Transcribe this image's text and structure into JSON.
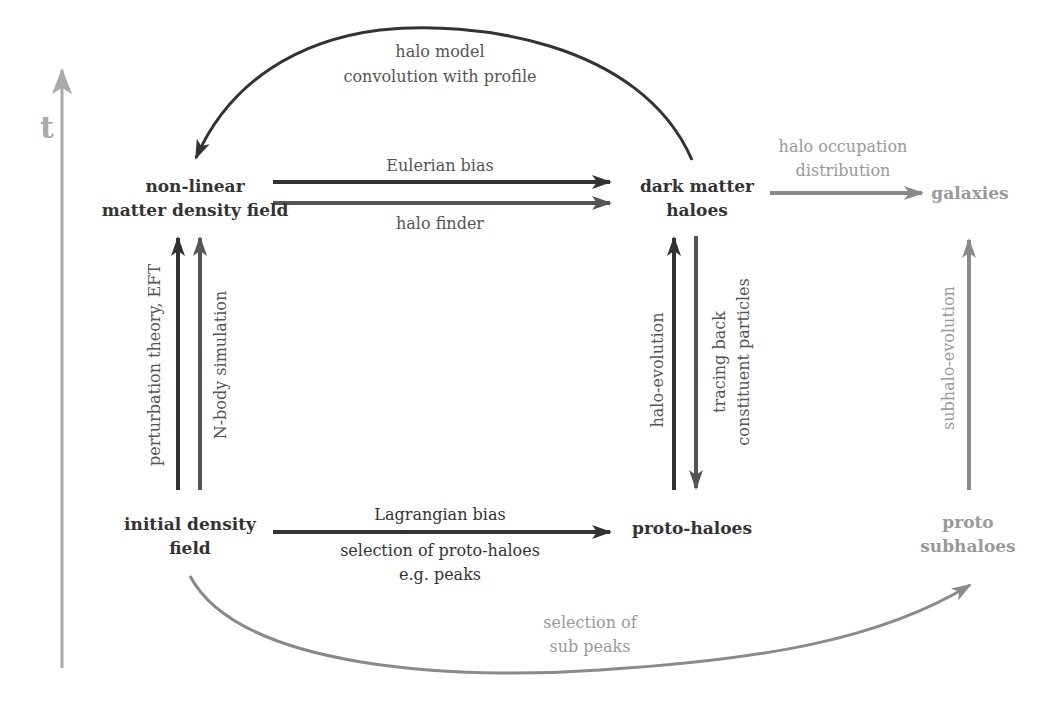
{
  "colors": {
    "dark": "#333333",
    "mid": "#555555",
    "light": "#999999",
    "axis": "#aaaaaa"
  },
  "axis": {
    "label": "t"
  },
  "nodes": {
    "nonlinear": {
      "line1": "non-linear",
      "line2": "matter density field"
    },
    "dm_haloes": {
      "line1": "dark matter",
      "line2": "haloes"
    },
    "galaxies": {
      "line1": "galaxies"
    },
    "initial": {
      "line1": "initial density",
      "line2": "field"
    },
    "proto_haloes": {
      "line1": "proto-haloes"
    },
    "proto_subhaloes": {
      "line1": "proto",
      "line2": "subhaloes"
    }
  },
  "edges": {
    "halo_model": {
      "line1": "halo model",
      "line2": "convolution with profile"
    },
    "eulerian": {
      "label": "Eulerian bias"
    },
    "halo_finder": {
      "label": "halo finder"
    },
    "hod": {
      "line1": "halo occupation",
      "line2": "distribution"
    },
    "pt": {
      "label": "perturbation theory, EFT"
    },
    "nbody": {
      "label": "N-body simulation"
    },
    "halo_evolution": {
      "label": "halo-evolution"
    },
    "tracing": {
      "line1": "tracing back",
      "line2": "constituent particles"
    },
    "subhalo_evolution": {
      "label": "subhalo-evolution"
    },
    "lagrangian": {
      "label": "Lagrangian bias",
      "line2": "selection of proto-haloes",
      "line3": "e.g. peaks"
    },
    "sub_peaks": {
      "line1": "selection of",
      "line2": "sub peaks"
    }
  }
}
